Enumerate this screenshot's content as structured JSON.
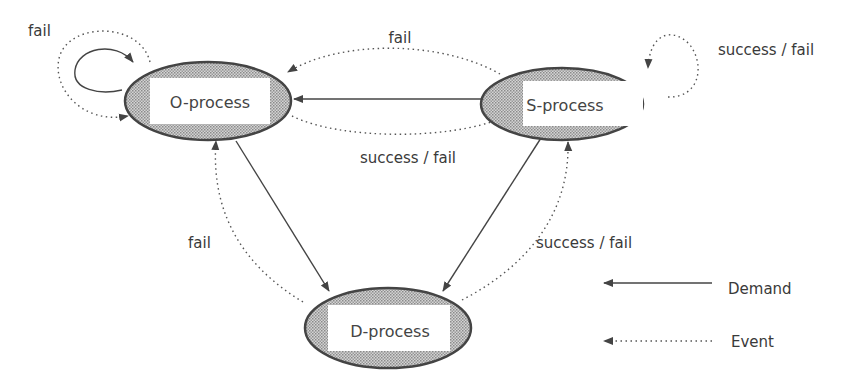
{
  "nodes": {
    "o": {
      "label": "O-process"
    },
    "s": {
      "label": "S-process"
    },
    "d": {
      "label": "D-process"
    }
  },
  "edge_labels": {
    "o_self": "fail",
    "s_self": "success / fail",
    "s_to_o": "fail",
    "o_to_s": "success / fail",
    "d_to_o": "fail",
    "d_to_s": "success / fail"
  },
  "legend": {
    "demand": "Demand",
    "event": "Event"
  },
  "colors": {
    "line": "#444444",
    "fill_pattern": "#9a9a9a",
    "text": "#3a3a3a"
  }
}
